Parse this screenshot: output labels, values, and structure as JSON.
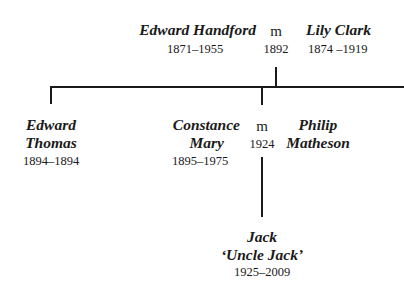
{
  "diagram": {
    "type": "family-tree",
    "generation1": {
      "person1": {
        "name": "Edward Handford",
        "dates": "1871–1955"
      },
      "marriage": {
        "symbol": "m",
        "year": "1892"
      },
      "person2": {
        "name": "Lily Clark",
        "dates": "1874 –1919"
      }
    },
    "generation2": {
      "child1": {
        "name_line1": "Edward",
        "name_line2": "Thomas",
        "dates": "1894–1894"
      },
      "child2": {
        "name_line1": "Constance",
        "name_line2": "Mary",
        "dates": "1895–1975"
      },
      "marriage": {
        "symbol": "m",
        "year": "1924"
      },
      "spouse": {
        "name_line1": "Philip",
        "name_line2": "Matheson"
      }
    },
    "generation3": {
      "child1": {
        "name_line1": "Jack",
        "name_line2": "‘Uncle Jack’",
        "dates": "1925–2009"
      }
    },
    "line_color": "#1a1a1a"
  }
}
